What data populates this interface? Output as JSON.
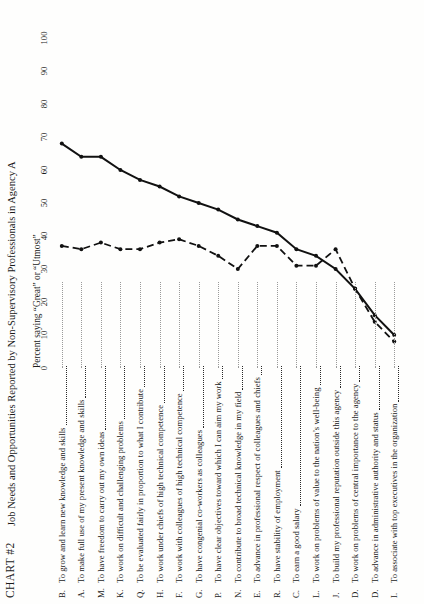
{
  "chart_number": "CHART #2",
  "title": "Job Needs and Opportunities Reported by Non-Supervisory Professionals in Agency A",
  "axis_title": "Percent saying “Great” or “Utmost”",
  "chart_data": {
    "type": "line",
    "title": "Job Needs and Opportunities Reported by Non-Supervisory Professionals in Agency A",
    "xlabel": "Percent saying “Great” or “Utmost”",
    "ylabel": "",
    "xlim": [
      0,
      100
    ],
    "grid": false,
    "orientation": "horizontal-categories-vertical-axis",
    "legend": "none",
    "ticks": [
      0,
      10,
      20,
      30,
      40,
      50,
      60,
      70,
      80,
      90,
      100
    ],
    "categories": [
      "To grow and learn new knowledge and skills",
      "To make full use of my present knowledge and skills",
      "To have freedom to carry out my own ideas",
      "To work on difficult and challenging problems",
      "To be evaluated fairly in proportion to what I contribute",
      "To work under chiefs of high technical competence",
      "To work with colleagues of high technical competence",
      "To have congenial co-workers as colleagues",
      "To have clear objectives toward which I can aim my work",
      "To contribute to broad technical knowledge in my field",
      "To advance in professional respect of colleagues and chiefs",
      "To have stability of employment",
      "To earn a good salary",
      "To work on problems of value to the nation’s well-being",
      "To build my professional reputation outside this agency",
      "To work on problems of central importance to the agency",
      "To advance in administrative authority and status",
      "To associate with top executives in the organization"
    ],
    "keys": [
      "B.",
      "A.",
      "M.",
      "K.",
      "Q.",
      "H.",
      "F.",
      "G.",
      "P.",
      "N.",
      "E.",
      "R.",
      "C.",
      "L.",
      "J.",
      "D.",
      "D.",
      "I."
    ],
    "series": [
      {
        "name": "Need",
        "style": "solid",
        "values": [
          68,
          64,
          64,
          60,
          57,
          55,
          52,
          50,
          48,
          45,
          43,
          41,
          36,
          34,
          30,
          24,
          16,
          10
        ]
      },
      {
        "name": "Opportunity",
        "style": "dashed",
        "values": [
          37,
          36,
          38,
          36,
          36,
          38,
          39,
          37,
          34,
          30,
          37,
          37,
          31,
          31,
          36,
          24,
          14,
          8
        ]
      }
    ]
  }
}
